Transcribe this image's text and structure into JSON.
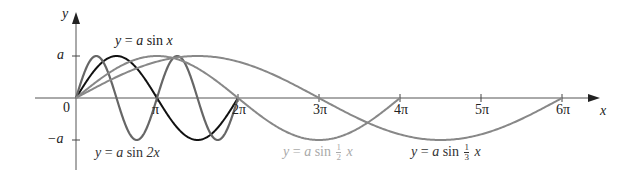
{
  "chart_data": {
    "type": "line",
    "title": "",
    "xlabel": "x",
    "ylabel": "y",
    "origin_label": "0",
    "x_ticks": [
      "π",
      "2π",
      "3π",
      "4π",
      "5π",
      "6π"
    ],
    "y_ticks": [
      "a",
      "−a"
    ],
    "xlim": [
      0,
      "6π"
    ],
    "ylim": [
      "−a",
      "a"
    ],
    "grid": false,
    "series": [
      {
        "name": "y = a sin x",
        "function": "a*sin(x)",
        "period": "2π",
        "color": "#111111",
        "label_parts": {
          "lhs": "y",
          "eq": "=",
          "coef": "a",
          "fn": "sin",
          "arg": "x"
        }
      },
      {
        "name": "y = a sin 2x",
        "function": "a*sin(2x)",
        "period": "π",
        "color": "#666666",
        "label_parts": {
          "lhs": "y",
          "eq": "=",
          "coef": "a",
          "fn": "sin",
          "arg": "2x"
        }
      },
      {
        "name": "y = a sin (1/2)x",
        "function": "a*sin(x/2)",
        "period": "4π",
        "color": "#888888",
        "label_parts": {
          "lhs": "y",
          "eq": "=",
          "coef": "a",
          "fn": "sin",
          "num": "1",
          "den": "2",
          "arg": "x"
        }
      },
      {
        "name": "y = a sin (1/3)x",
        "function": "a*sin(x/3)",
        "period": "6π",
        "color": "#888888",
        "label_parts": {
          "lhs": "y",
          "eq": "=",
          "coef": "a",
          "fn": "sin",
          "num": "1",
          "den": "3",
          "arg": "x"
        }
      }
    ]
  }
}
